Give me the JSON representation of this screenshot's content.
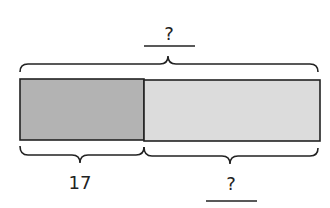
{
  "diagram": {
    "type": "tape-diagram",
    "total_label": "?",
    "parts": [
      {
        "label": "17",
        "fill": "#b3b3b3"
      },
      {
        "label": "?",
        "fill": "#dcdcdc"
      }
    ],
    "stroke": "#222222"
  }
}
